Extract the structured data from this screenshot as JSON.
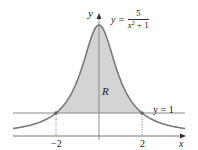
{
  "figure": {
    "y_axis_label": "y",
    "x_axis_label": "x",
    "region_label": "R",
    "curve_label": {
      "lhs": "y =",
      "numerator": "5",
      "denominator_base": "x",
      "denominator_exp": "2",
      "denominator_rest": " + 1"
    },
    "line_label": "y = 1",
    "tick_labels": [
      "−2",
      "2"
    ],
    "colors": {
      "curve": "#7a7a7a",
      "shade": "#d4d4d4",
      "axis": "#555555",
      "line": "#8a8a8a"
    }
  },
  "chart_data": {
    "type": "area",
    "title": "",
    "functions": [
      {
        "name": "y = 5/(x^2 + 1)",
        "expression": "5/(x^2+1)"
      },
      {
        "name": "y = 1",
        "expression": "1"
      }
    ],
    "shaded_region": {
      "label": "R",
      "between": [
        "y = 5/(x^2+1)",
        "y = 1"
      ],
      "x_range": [
        -2,
        2
      ]
    },
    "x_ticks": [
      -2,
      2
    ],
    "intersections": [
      {
        "x": -2,
        "y": 1
      },
      {
        "x": 2,
        "y": 1
      }
    ],
    "xlabel": "x",
    "ylabel": "y",
    "xlim": [
      -4,
      4
    ],
    "ylim": [
      0,
      5
    ],
    "grid": false
  }
}
